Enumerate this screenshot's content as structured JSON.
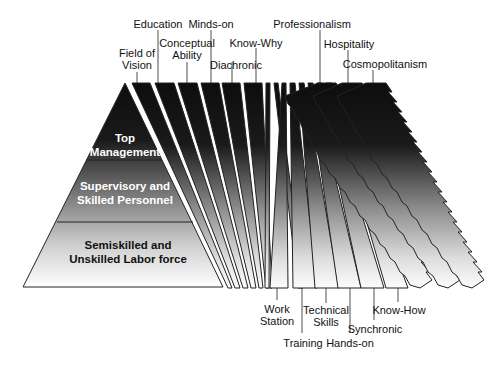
{
  "diagram": {
    "type": "pyramid-with-fanned-strips",
    "pyramid": {
      "tiers": [
        {
          "line1": "Top",
          "line2": "Management",
          "text_color": "#ffffff"
        },
        {
          "line1": "Supervisory and",
          "line2": "Skilled Personnel",
          "text_color": "#ffffff"
        },
        {
          "line1": "Semiskilled and",
          "line2": "Unskilled Labor force",
          "text_color": "#111111"
        }
      ]
    },
    "top_labels": [
      {
        "line1": "Field of",
        "line2": "Vision"
      },
      {
        "line1": "Education",
        "line2": ""
      },
      {
        "line1": "Conceptual",
        "line2": "Ability"
      },
      {
        "line1": "Minds-on",
        "line2": ""
      },
      {
        "line1": "Diachronic",
        "line2": ""
      },
      {
        "line1": "Know-Why",
        "line2": ""
      },
      {
        "line1": "Professionalism",
        "line2": ""
      },
      {
        "line1": "Hospitality",
        "line2": ""
      },
      {
        "line1": "Cosmopolitanism",
        "line2": ""
      }
    ],
    "bottom_labels": [
      {
        "line1": "Work",
        "line2": "Station"
      },
      {
        "line1": "Training",
        "line2": ""
      },
      {
        "line1": "Technical",
        "line2": "Skills"
      },
      {
        "line1": "Hands-on",
        "line2": ""
      },
      {
        "line1": "Synchronic",
        "line2": ""
      },
      {
        "line1": "Know-How",
        "line2": ""
      }
    ],
    "colors": {
      "dark": "#0d0d0d",
      "light": "#ffffff",
      "outline": "#222222"
    }
  }
}
